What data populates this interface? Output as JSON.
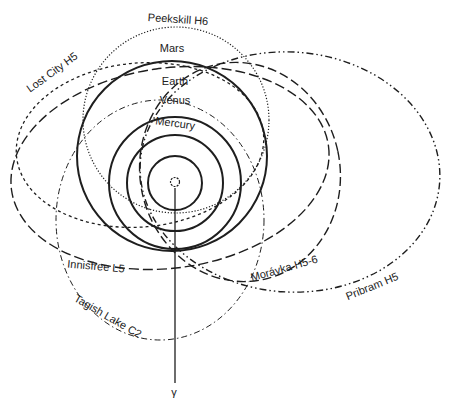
{
  "diagram": {
    "type": "orbital-diagram",
    "center": {
      "label": "Sun",
      "icon": "sun-icon"
    },
    "direction_label": "γ",
    "planets": [
      {
        "name": "Mercury",
        "label": "Mercury"
      },
      {
        "name": "Venus",
        "label": "Venus"
      },
      {
        "name": "Earth",
        "label": "Earth"
      },
      {
        "name": "Mars",
        "label": "Mars"
      }
    ],
    "meteorite_orbits": [
      {
        "id": "peekskill",
        "label": "Peekskill H6",
        "line_style": "dotted"
      },
      {
        "id": "lost-city",
        "label": "Lost City H5",
        "line_style": "short-dashed"
      },
      {
        "id": "innisfree",
        "label": "Innisfree L5",
        "line_style": "long-dashed"
      },
      {
        "id": "tagish-lake",
        "label": "Tagish Lake C2",
        "line_style": "dash-dot"
      },
      {
        "id": "moravka",
        "label": "Morávka H5-6",
        "line_style": "long-dashed"
      },
      {
        "id": "pribram",
        "label": "Pribram H5",
        "line_style": "dash-dot-dot"
      }
    ],
    "colors": {
      "line": "#1e1e1e",
      "text": "#222222",
      "background": "#ffffff"
    }
  }
}
